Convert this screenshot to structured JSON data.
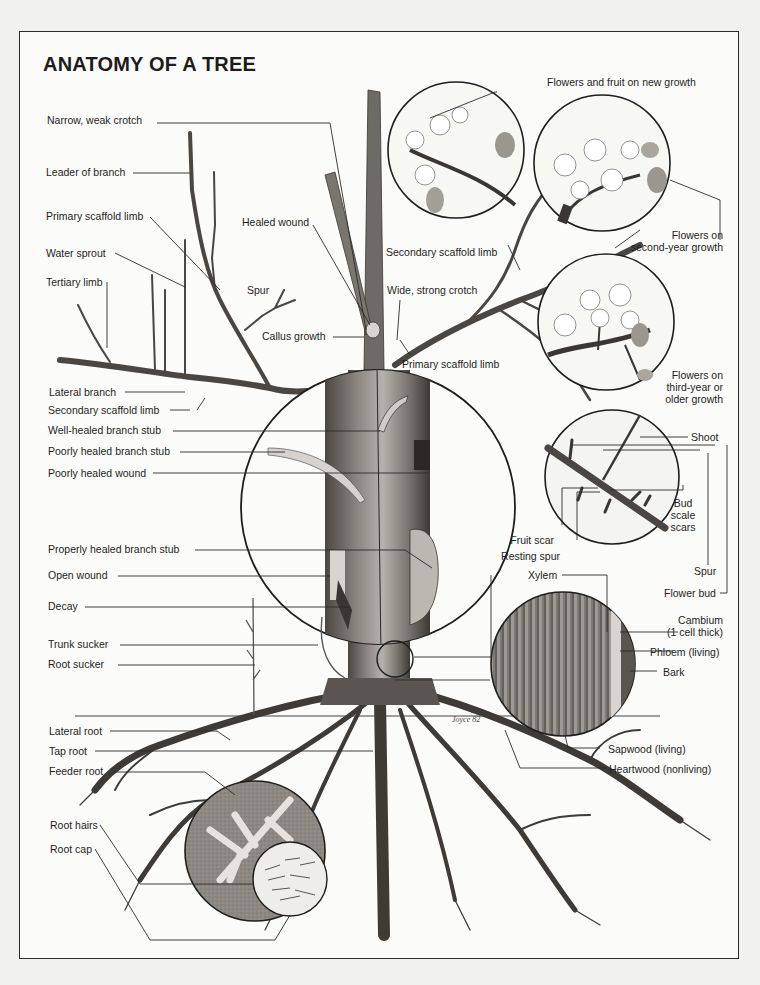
{
  "title": "ANATOMY OF A TREE",
  "labels": {
    "narrow_weak_crotch": "Narrow, weak crotch",
    "leader_of_branch": "Leader of branch",
    "primary_scaffold_limb_left": "Primary scaffold limb",
    "water_sprout": "Water sprout",
    "tertiary_limb": "Tertiary limb",
    "healed_wound": "Healed wound",
    "spur_branch": "Spur",
    "callus_growth": "Callus growth",
    "lateral_branch": "Lateral branch",
    "secondary_scaffold_limb_left": "Secondary scaffold limb",
    "well_healed_branch_stub": "Well-healed branch stub",
    "poorly_healed_branch_stub": "Poorly healed branch stub",
    "poorly_healed_wound": "Poorly healed wound",
    "properly_healed_branch_stub": "Properly healed branch stub",
    "open_wound": "Open wound",
    "decay": "Decay",
    "trunk_sucker": "Trunk sucker",
    "root_sucker": "Root sucker",
    "lateral_root": "Lateral root",
    "tap_root": "Tap root",
    "feeder_root": "Feeder root",
    "root_hairs": "Root hairs",
    "root_cap": "Root cap",
    "flowers_fruit_new_growth": "Flowers and fruit on new growth",
    "secondary_scaffold_limb_right": "Secondary scaffold limb",
    "flowers_second_year_1": "Flowers on",
    "flowers_second_year_2": "second-year growth",
    "wide_strong_crotch": "Wide, strong crotch",
    "primary_scaffold_limb_right": "Primary scaffold limb",
    "flowers_third_year_1": "Flowers on",
    "flowers_third_year_2": "third-year or",
    "flowers_third_year_3": "older growth",
    "shoot": "Shoot",
    "fruit_scar": "Fruit scar",
    "resting_spur": "Resting spur",
    "bud_scale_scars_1": "Bud",
    "bud_scale_scars_2": "scale",
    "bud_scale_scars_3": "scars",
    "spur_detail": "Spur",
    "flower_bud": "Flower bud",
    "xylem": "Xylem",
    "cambium_1": "Cambium",
    "cambium_2": "(1 cell thick)",
    "phloem": "Phloem (living)",
    "bark": "Bark",
    "sapwood": "Sapwood (living)",
    "heartwood": "Heartwood (nonliving)"
  },
  "signature": "Joyce 82",
  "colors": {
    "paper": "#fbfbf9",
    "ink": "#1e1e1e",
    "bark": "#5a5550",
    "wood": "#a8a5a0",
    "soil_circle": "#8f8a84"
  }
}
